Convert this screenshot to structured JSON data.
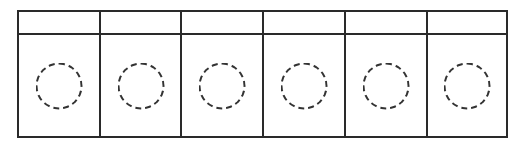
{
  "diagram": {
    "columns": 6,
    "header": {
      "cells": [
        "",
        "",
        "",
        "",
        "",
        ""
      ]
    },
    "body": {
      "cells": [
        {
          "shape": "dashed-circle",
          "label": ""
        },
        {
          "shape": "dashed-circle",
          "label": ""
        },
        {
          "shape": "dashed-circle",
          "label": ""
        },
        {
          "shape": "dashed-circle",
          "label": ""
        },
        {
          "shape": "dashed-circle",
          "label": ""
        },
        {
          "shape": "dashed-circle",
          "label": ""
        }
      ]
    },
    "colors": {
      "line": "#2a2a2a",
      "circle_stroke": "#333333",
      "background": "#ffffff"
    }
  }
}
